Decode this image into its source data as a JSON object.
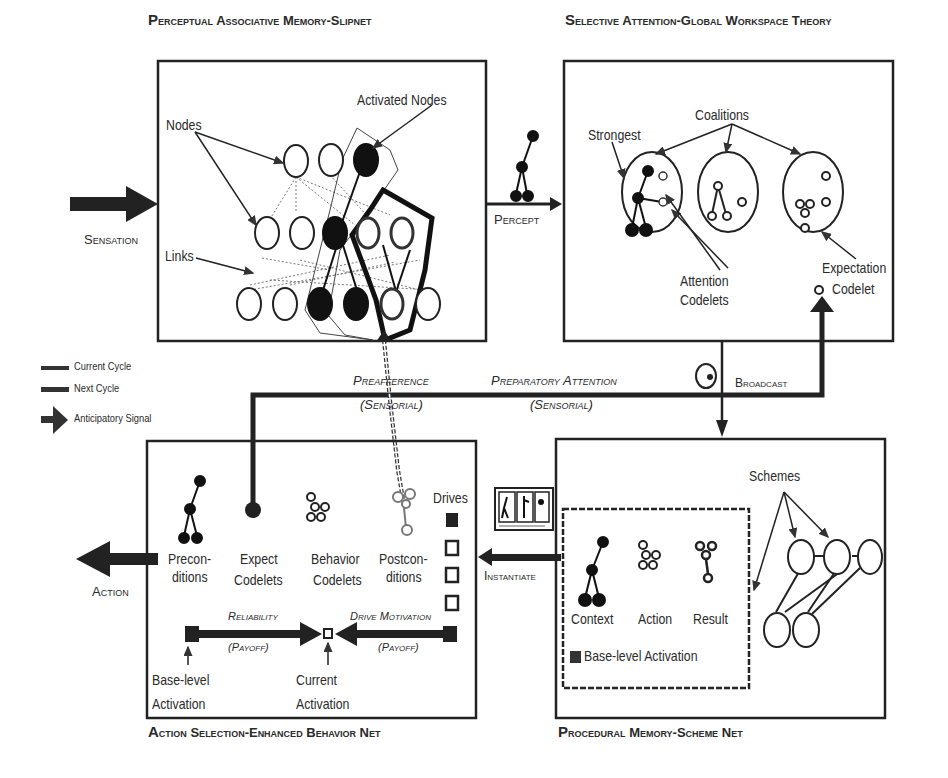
{
  "modules": {
    "pam": {
      "title": "Perceptual Associative Memory-Slipnet",
      "labels": {
        "nodes": "Nodes",
        "activated_nodes": "Activated Nodes",
        "links": "Links"
      }
    },
    "gwt": {
      "title": "Selective Attention-Global Workspace Theory",
      "labels": {
        "coalitions": "Coalitions",
        "strongest": "Strongest",
        "attention_codelets_1": "Attention",
        "attention_codelets_2": "Codelets",
        "expectation_codelet_1": "Expectation",
        "expectation_codelet_2": "Codelet"
      }
    },
    "action_selection": {
      "title": "Action Selection-Enhanced Behavior Net",
      "labels": {
        "preconditions_1": "Precon-",
        "preconditions_2": "ditions",
        "expect_codelets_1": "Expect",
        "expect_codelets_2": "Codelets",
        "behavior_codelets_1": "Behavior",
        "behavior_codelets_2": "Codelets",
        "postconditions_1": "Postcon-",
        "postconditions_2": "ditions",
        "drives": "Drives",
        "reliability": "Reliability",
        "reliability_payoff": "(Payoff)",
        "drive_motivation": "Drive Motivation",
        "drive_motivation_payoff": "(Payoff)",
        "base_level_activation_1": "Base-level",
        "base_level_activation_2": "Activation",
        "current_activation_1": "Current",
        "current_activation_2": "Activation"
      }
    },
    "procedural": {
      "title": "Procedural Memory-Scheme Net",
      "labels": {
        "schemes": "Schemes",
        "context": "Context",
        "action": "Action",
        "result": "Result",
        "base_level_activation": "Base-level Activation"
      }
    }
  },
  "flows": {
    "sensation": "Sensation",
    "percept": "Percept",
    "broadcast": "Broadcast",
    "instantiate": "Instantiate",
    "action": "Action",
    "preafference_1": "Preafference",
    "preafference_2": "(Sensorial)",
    "preparatory_attention_1": "Preparatory Attention",
    "preparatory_attention_2": "(Sensorial)"
  },
  "legend": [
    {
      "label": "Current Cycle",
      "symbol": "thin-bar"
    },
    {
      "label": "Next Cycle",
      "symbol": "thick-bar"
    },
    {
      "label": "Anticipatory Signal",
      "symbol": "arrow"
    }
  ],
  "colors": {
    "ink": "#1e1e1e",
    "background": "#ffffff",
    "filled_node": "#111111"
  }
}
